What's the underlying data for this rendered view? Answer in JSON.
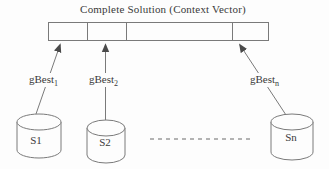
{
  "title": "Complete Solution (Context Vector)",
  "context_vector": {
    "description": "segmented horizontal bar",
    "segment_count": 4
  },
  "arrows": [
    {
      "label_base": "gBest",
      "label_sub": "1"
    },
    {
      "label_base": "gBest",
      "label_sub": "2"
    },
    {
      "label_base": "gBest",
      "label_sub": "n"
    }
  ],
  "swarms": [
    {
      "label": "S1"
    },
    {
      "label": "S2"
    },
    {
      "label": "Sn"
    }
  ],
  "ellipsis": "dashed line between S2 and Sn",
  "colors": {
    "background": "#fdfdfd",
    "line": "#7a7a7a",
    "dash": "#9a9a9a",
    "text": "#3a3a3a",
    "arrowhead": "#4a4a4a"
  }
}
